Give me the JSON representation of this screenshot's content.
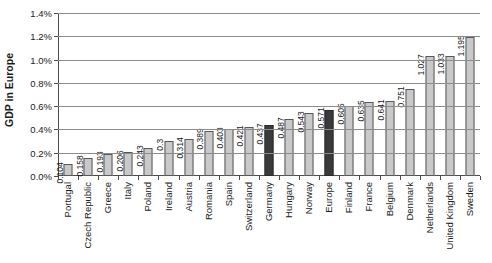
{
  "chart_data": {
    "type": "bar",
    "title": "",
    "subtitle": "",
    "xlabel": "",
    "ylabel": "GDP in Europe",
    "ylim": [
      0,
      1.4
    ],
    "y_tick_labels": [
      "0.0%",
      "0.2%",
      "0.4%",
      "0.6%",
      "0.8%",
      "1.0%",
      "1.2%",
      "1.4%"
    ],
    "y_tick_values": [
      0.0,
      0.2,
      0.4,
      0.6,
      0.8,
      1.0,
      1.2,
      1.4
    ],
    "grid": true,
    "legend": "none",
    "value_label_unit": "percent",
    "categories": [
      "Portugal",
      "Czech Republic",
      "Greece",
      "Italy",
      "Poland",
      "Ireland",
      "Austria",
      "Romania",
      "Spain",
      "Switzerland",
      "Germany",
      "Hungary",
      "Norway",
      "Europe",
      "Finland",
      "France",
      "Belgium",
      "Denmark",
      "Netherlands",
      "United Kingdom",
      "Sweden"
    ],
    "values": [
      0.104,
      0.158,
      0.193,
      0.206,
      0.243,
      0.3,
      0.314,
      0.389,
      0.403,
      0.421,
      0.437,
      0.487,
      0.543,
      0.571,
      0.605,
      0.635,
      0.641,
      0.751,
      1.027,
      1.033,
      1.195
    ],
    "value_labels": [
      "0.104",
      "0.158",
      "0.193",
      "0.206",
      "0.243",
      "0.3",
      "0.314",
      "0.389",
      "0.403",
      "0.421",
      "0.437",
      "0.487",
      "0.543",
      "0.571",
      "0.605",
      "0.635",
      "0.641",
      "0.751",
      "1.027",
      "1.033",
      "1.195"
    ],
    "highlighted_categories": [
      "Germany",
      "Europe"
    ],
    "colors": {
      "bar_fill": "#c9c9c9",
      "bar_border": "#58585a",
      "bar_highlight_fill": "#3a3a3a",
      "bar_highlight_border": "#2a2a2a",
      "gridline": "#8c8c8c",
      "axis": "#4d4d4d",
      "text": "#1a1a1a",
      "background": "#ffffff"
    }
  }
}
